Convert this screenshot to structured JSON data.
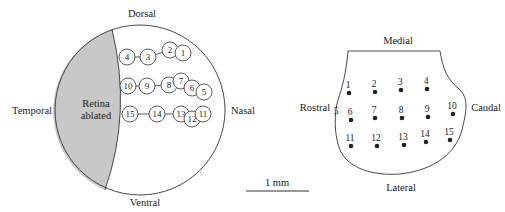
{
  "retina": {
    "labels": {
      "dorsal": "Dorsal",
      "ventral": "Ventral",
      "temporal": "Temporal",
      "nasal": "Nasal",
      "ablated_line1": "Retina",
      "ablated_line2": "ablated"
    },
    "ablated_fill": "#c8c8c8",
    "rows": [
      {
        "name": "row-1",
        "sites": [
          {
            "id": "4",
            "x": 127,
            "y": 57
          },
          {
            "id": "3",
            "x": 148,
            "y": 57
          },
          {
            "id": "2",
            "x": 170,
            "y": 50
          },
          {
            "id": "1",
            "x": 183,
            "y": 53
          }
        ]
      },
      {
        "name": "row-2",
        "sites": [
          {
            "id": "10",
            "x": 128,
            "y": 86
          },
          {
            "id": "9",
            "x": 147,
            "y": 86
          },
          {
            "id": "8",
            "x": 169,
            "y": 85
          },
          {
            "id": "7",
            "x": 181,
            "y": 81
          },
          {
            "id": "6",
            "x": 192,
            "y": 88
          },
          {
            "id": "5",
            "x": 204,
            "y": 92
          }
        ]
      },
      {
        "name": "row-3",
        "sites": [
          {
            "id": "15",
            "x": 130,
            "y": 114
          },
          {
            "id": "14",
            "x": 157,
            "y": 114
          },
          {
            "id": "13",
            "x": 181,
            "y": 114
          },
          {
            "id": "12",
            "x": 192,
            "y": 119
          },
          {
            "id": "11",
            "x": 203,
            "y": 114
          }
        ]
      }
    ]
  },
  "scale_bar": {
    "label": "1 mm"
  },
  "tectum": {
    "labels": {
      "medial": "Medial",
      "lateral": "Lateral",
      "rostral": "Rostral",
      "caudal": "Caudal"
    },
    "edge_label": {
      "id": "5",
      "x": 336,
      "y": 114
    },
    "sites": [
      {
        "id": "1",
        "x": 349,
        "y": 93
      },
      {
        "id": "2",
        "x": 375,
        "y": 92
      },
      {
        "id": "3",
        "x": 401,
        "y": 90
      },
      {
        "id": "4",
        "x": 427,
        "y": 89
      },
      {
        "id": "6",
        "x": 351,
        "y": 120
      },
      {
        "id": "7",
        "x": 375,
        "y": 118
      },
      {
        "id": "8",
        "x": 402,
        "y": 118
      },
      {
        "id": "9",
        "x": 428,
        "y": 117
      },
      {
        "id": "10",
        "x": 453,
        "y": 114
      },
      {
        "id": "11",
        "x": 351,
        "y": 146
      },
      {
        "id": "12",
        "x": 377,
        "y": 146
      },
      {
        "id": "13",
        "x": 404,
        "y": 145
      },
      {
        "id": "14",
        "x": 426,
        "y": 142
      },
      {
        "id": "15",
        "x": 450,
        "y": 140
      }
    ]
  }
}
